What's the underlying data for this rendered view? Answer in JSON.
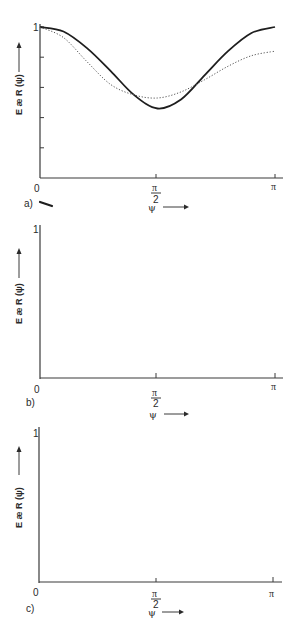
{
  "chart_data": [
    {
      "panel": "a)",
      "type": "line",
      "title": "",
      "xlabel": "ψ",
      "ylabel": "E æ_R(ψ)",
      "x_ticks": [
        "0",
        "π/2",
        "π"
      ],
      "y_ticks": [
        "1"
      ],
      "xlim": [
        0,
        3.1416
      ],
      "ylim": [
        0,
        1
      ],
      "grid": false,
      "x_units": "fraction of π",
      "x": [
        0,
        0.1,
        0.2,
        0.3,
        0.4,
        0.5,
        0.6,
        0.7,
        0.8,
        0.9,
        1.0
      ],
      "series": [
        {
          "name": "solid",
          "style": "solid",
          "values": [
            1.0,
            0.97,
            0.86,
            0.71,
            0.55,
            0.46,
            0.52,
            0.68,
            0.84,
            0.96,
            1.0
          ]
        },
        {
          "name": "dotted",
          "style": "dotted",
          "values": [
            1.0,
            0.93,
            0.77,
            0.62,
            0.55,
            0.53,
            0.57,
            0.65,
            0.74,
            0.81,
            0.84
          ]
        }
      ]
    },
    {
      "panel": "b)",
      "type": "line",
      "title": "",
      "xlabel": "ψ",
      "ylabel": "E æ_R(ψ)",
      "x_ticks": [
        "0",
        "π/2",
        "π"
      ],
      "y_ticks": [
        "1"
      ],
      "xlim": [
        0,
        3.1416
      ],
      "ylim": [
        0,
        1
      ],
      "grid": false,
      "x_units": "fraction of π",
      "x": [
        0,
        0.1,
        0.2,
        0.3,
        0.4,
        0.5,
        0.6,
        0.7,
        0.8,
        0.9,
        1.0
      ],
      "series": [
        {
          "name": "solid",
          "style": "solid",
          "values": [
            1.0,
            0.93,
            0.7,
            0.38,
            0.1,
            -0.03,
            0.12,
            0.44,
            0.74,
            0.94,
            1.0
          ]
        },
        {
          "name": "dotted",
          "style": "dotted",
          "values": [
            1.0,
            0.88,
            0.62,
            0.35,
            0.17,
            0.13,
            0.21,
            0.41,
            0.61,
            0.71,
            0.74
          ]
        }
      ]
    },
    {
      "panel": "c)",
      "type": "line",
      "title": "",
      "xlabel": "ψ",
      "ylabel": "E æ_R(ψ)",
      "x_ticks": [
        "0",
        "π/2",
        "π"
      ],
      "y_ticks": [
        "1"
      ],
      "xlim": [
        0,
        3.1416
      ],
      "ylim": [
        0,
        1
      ],
      "grid": false,
      "x_units": "fraction of π",
      "x": [
        0,
        0.1,
        0.2,
        0.3,
        0.4,
        0.5,
        0.6,
        0.7,
        0.8,
        0.9,
        1.0
      ],
      "series": [
        {
          "name": "solid",
          "style": "solid",
          "values": [
            1.0,
            0.94,
            0.75,
            0.49,
            0.26,
            0.17,
            0.28,
            0.5,
            0.77,
            0.95,
            1.0
          ]
        },
        {
          "name": "dotted",
          "style": "dotted",
          "values": [
            1.0,
            0.91,
            0.69,
            0.46,
            0.32,
            0.27,
            0.34,
            0.5,
            0.7,
            0.82,
            0.86
          ]
        }
      ]
    }
  ],
  "labels": {
    "panel_a": "a)",
    "panel_b": "b)",
    "panel_c": "c)",
    "origin": "0",
    "half_pi_num": "π",
    "half_pi_den": "2",
    "pi": "π",
    "y_one": "1",
    "xlabel_a": "ψ",
    "xlabel_b": "ψ",
    "xlabel_c": "ψ",
    "ylabel": "E æ R (ψ)"
  }
}
